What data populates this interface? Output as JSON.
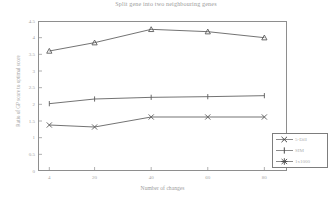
{
  "chart_data": {
    "type": "line",
    "title": "Split gene into two neighbouring genes",
    "xlabel": "Number of changes",
    "ylabel": "Ratio of GP score to optimal score",
    "x": [
      4,
      20,
      40,
      60,
      80
    ],
    "xtick_labels": [
      "4",
      "20",
      "40",
      "60",
      "80"
    ],
    "ytick_labels": [
      "4.5",
      "4",
      "3.5",
      "3",
      "2.5",
      "2",
      "1.5",
      "1",
      "0.5",
      "0"
    ],
    "ytick_values": [
      4.5,
      4,
      3.5,
      3,
      2.5,
      2,
      1.5,
      1,
      0.5,
      0
    ],
    "ylim": [
      0,
      4.5
    ],
    "xlim": [
      0,
      88
    ],
    "grid": false,
    "legend_position": "bottom-right",
    "series": [
      {
        "name": "1x1000",
        "marker": "triangle",
        "color": "#5a5a5a",
        "values": [
          3.6,
          3.85,
          4.25,
          4.18,
          4.0
        ]
      },
      {
        "name": "SIM",
        "marker": "plus",
        "color": "#5a5a5a",
        "values": [
          2.02,
          2.16,
          2.21,
          2.23,
          2.26
        ]
      },
      {
        "name": "5-Dill",
        "marker": "cross",
        "color": "#5a5a5a",
        "values": [
          1.38,
          1.32,
          1.62,
          1.62,
          1.62
        ]
      }
    ]
  },
  "legend": {
    "entries": [
      {
        "label": "5-Dill",
        "marker": "cross"
      },
      {
        "label": "SIM",
        "marker": "plus"
      },
      {
        "label": "1x1000",
        "marker": "star"
      }
    ]
  }
}
